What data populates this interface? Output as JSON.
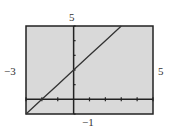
{
  "chart_data": {
    "type": "line",
    "title": "",
    "xlabel": "",
    "ylabel": "",
    "xlim": [
      -3,
      5
    ],
    "ylim": [
      -1,
      5
    ],
    "window_labels": {
      "xmin": "−3",
      "xmax": "5",
      "ymin": "−1",
      "ymax": "5"
    },
    "grid": false,
    "tick_spacing": 1,
    "series": [
      {
        "name": "y = x + 2",
        "x": [
          -3,
          -2,
          -1,
          0,
          1,
          2,
          3
        ],
        "y": [
          -1,
          0,
          1,
          2,
          3,
          4,
          5
        ]
      }
    ],
    "colors": {
      "background": "#d9d9d9",
      "line": "#333333",
      "axes": "#222222",
      "frame": "#222222"
    }
  }
}
